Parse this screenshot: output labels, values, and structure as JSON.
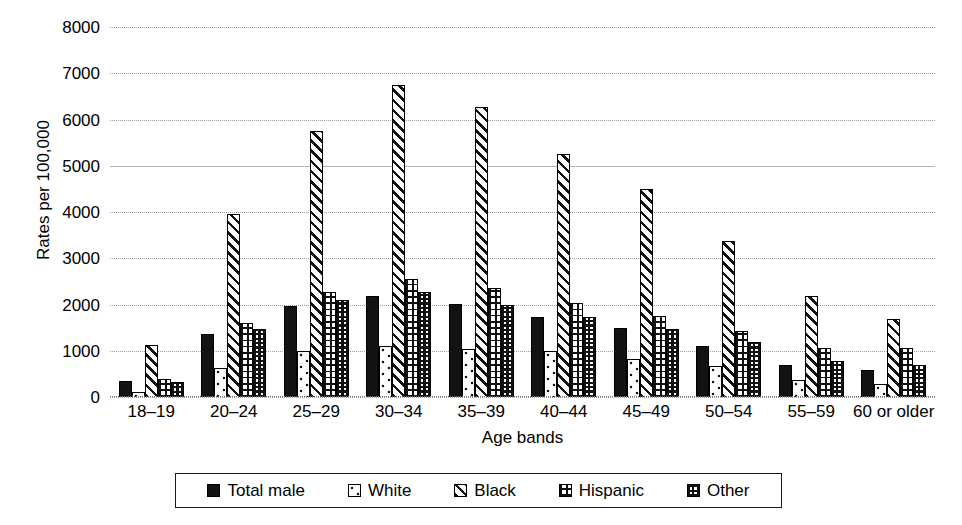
{
  "chart_data": {
    "type": "bar",
    "title": "",
    "xlabel": "Age bands",
    "ylabel": "Rates per 100,000",
    "ylim": [
      0,
      8000
    ],
    "ytick_labels": [
      "8000",
      "7000",
      "6000",
      "5000",
      "4000",
      "3000",
      "2000",
      "1000",
      "0"
    ],
    "yticks": [
      8000,
      7000,
      6000,
      5000,
      4000,
      3000,
      2000,
      1000,
      0
    ],
    "grid": true,
    "legend_position": "bottom",
    "categories": [
      "18–19",
      "20–24",
      "25–29",
      "30–34",
      "35–39",
      "40–44",
      "45–49",
      "50–54",
      "55–59",
      "60 or older"
    ],
    "series": [
      {
        "name": "Total male",
        "pattern": "solid-black",
        "values": [
          350,
          1370,
          1960,
          2180,
          2010,
          1720,
          1490,
          1110,
          700,
          580
        ]
      },
      {
        "name": "White",
        "pattern": "dotted",
        "values": [
          110,
          620,
          1000,
          1110,
          1040,
          990,
          820,
          660,
          370,
          290
        ]
      },
      {
        "name": "Black",
        "pattern": "diagonal-hatch",
        "values": [
          1120,
          3950,
          5750,
          6750,
          6270,
          5250,
          4500,
          3370,
          2180,
          1690
        ]
      },
      {
        "name": "Hispanic",
        "pattern": "grid",
        "values": [
          390,
          1610,
          2280,
          2550,
          2350,
          2040,
          1760,
          1420,
          1060,
          1060
        ]
      },
      {
        "name": "Other",
        "pattern": "dense-checker",
        "values": [
          320,
          1460,
          2090,
          2270,
          2000,
          1730,
          1480,
          1190,
          780,
          700
        ]
      }
    ]
  },
  "colors": {
    "ink": "#000000",
    "gridline": "#9a9a9a",
    "background": "#ffffff"
  }
}
